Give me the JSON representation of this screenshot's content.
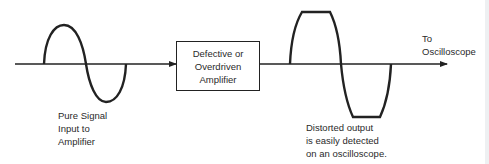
{
  "diagram": {
    "type": "signal-flow",
    "colors": {
      "stroke": "#222222",
      "text": "#2a2a2a",
      "background": "#ffffff"
    },
    "input_signal": {
      "label_lines": [
        "Pure Signal",
        "Input to",
        "Amplifier"
      ],
      "waveform": "sine"
    },
    "amplifier_block": {
      "label_lines": [
        "Defective or",
        "Overdriven",
        "Amplifier"
      ]
    },
    "output_signal": {
      "label_lines": [
        "Distorted output",
        "is easily detected",
        "on an oscilloscope."
      ],
      "waveform": "clipped-sine"
    },
    "destination": {
      "label_lines": [
        "To",
        "Oscilloscope"
      ]
    }
  }
}
